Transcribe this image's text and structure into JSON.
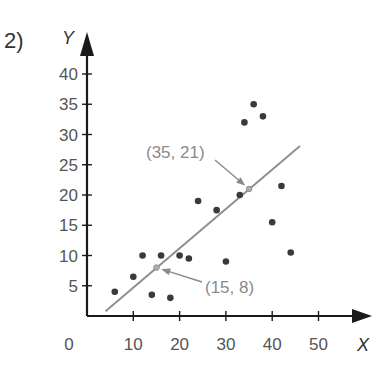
{
  "problem_number": "2)",
  "colors": {
    "axis": "#1a1a1a",
    "points": "#3a3a3a",
    "trend_line": "#8f8f8f",
    "annotation": "#8a8a8a"
  },
  "chart_data": {
    "type": "scatter",
    "title": "",
    "xlabel": "X",
    "ylabel": "Y",
    "xlim": [
      0,
      55
    ],
    "ylim": [
      0,
      43
    ],
    "x_ticks": [
      10,
      20,
      30,
      40,
      50
    ],
    "y_ticks": [
      5,
      10,
      15,
      20,
      25,
      30,
      35,
      40
    ],
    "origin_label": "0",
    "grid": false,
    "legend": null,
    "series": [
      {
        "name": "data",
        "points": [
          [
            6,
            4
          ],
          [
            10,
            6.5
          ],
          [
            12,
            10
          ],
          [
            14,
            3.5
          ],
          [
            16,
            10
          ],
          [
            18,
            3
          ],
          [
            20,
            10
          ],
          [
            22,
            9.5
          ],
          [
            24,
            19
          ],
          [
            28,
            17.5
          ],
          [
            30,
            9
          ],
          [
            33,
            20
          ],
          [
            34,
            32
          ],
          [
            36,
            35
          ],
          [
            38,
            33
          ],
          [
            40,
            15.5
          ],
          [
            42,
            21.5
          ],
          [
            44,
            10.5
          ]
        ]
      }
    ],
    "trend_line": {
      "from": [
        4,
        0.8
      ],
      "to": [
        46,
        28.1
      ],
      "marked_points": [
        {
          "x": 15,
          "y": 8,
          "label": "(15, 8)"
        },
        {
          "x": 35,
          "y": 21,
          "label": "(35, 21)"
        }
      ]
    }
  }
}
